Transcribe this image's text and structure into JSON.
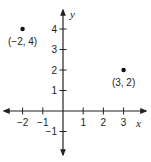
{
  "chart_data": {
    "type": "scatter",
    "title": "",
    "xlabel": "x",
    "ylabel": "y",
    "xlim": [
      -3,
      4
    ],
    "ylim": [
      -2,
      5
    ],
    "grid": false,
    "x_ticks": [
      -2,
      -1,
      1,
      2,
      3
    ],
    "x_tick_labels": [
      "−2",
      "−1",
      "1",
      "2",
      "3"
    ],
    "y_ticks": [
      -1,
      1,
      2,
      3,
      4
    ],
    "y_tick_labels": [
      "−1",
      "1",
      "2",
      "3",
      "4"
    ],
    "points": [
      {
        "x": -2,
        "y": 4,
        "label": "(−2, 4)"
      },
      {
        "x": 3,
        "y": 2,
        "label": "(3, 2)"
      }
    ]
  },
  "axes": {
    "x_label": "x",
    "y_label": "y"
  },
  "colors": {
    "axis": "#222222",
    "point": "#111111",
    "background": "#ffffff"
  }
}
